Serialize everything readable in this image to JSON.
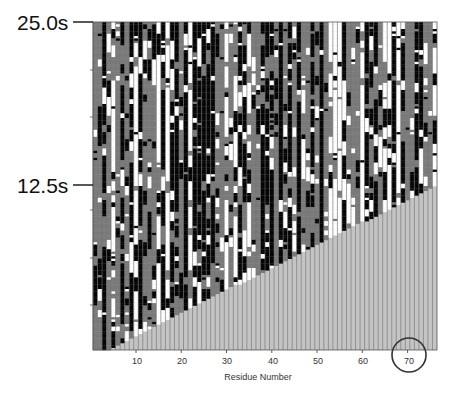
{
  "chart_data": {
    "type": "heatmap",
    "title": "",
    "xlabel": "Residue Number",
    "ylabel": "",
    "x_range": [
      1,
      76
    ],
    "y_range_seconds": [
      0,
      25.0
    ],
    "x_ticks": [
      10,
      20,
      30,
      40,
      50,
      60,
      70
    ],
    "y_ticks": [
      {
        "value": 25.0,
        "label": "25.0s"
      },
      {
        "value": 12.5,
        "label": "12.5s"
      }
    ],
    "grid": false,
    "legend": null,
    "cell_states": [
      "black",
      "dark-gray",
      "white",
      "light-gray (not yet synthesized)"
    ],
    "colors": {
      "black": "#050505",
      "dark_gray": "#7a7a7a",
      "white": "#ffffff",
      "unsynthesized": "#c4c4c4",
      "column_separator": "#6e6e6e"
    },
    "triangle_region": {
      "description": "light-gray region below diagonal: residues not yet emerged",
      "start": {
        "residue": 4,
        "time_s": 0
      },
      "end": {
        "residue": 76,
        "time_s": 12.4
      }
    },
    "annotations": [
      {
        "type": "circle",
        "target": "x tick 70",
        "label": "70"
      }
    ]
  },
  "axes": {
    "y_top_label": "25.0s",
    "y_mid_label": "12.5s",
    "x_label": "Residue Number",
    "x_tick_labels": [
      "10",
      "20",
      "30",
      "40",
      "50",
      "60",
      "70"
    ]
  }
}
